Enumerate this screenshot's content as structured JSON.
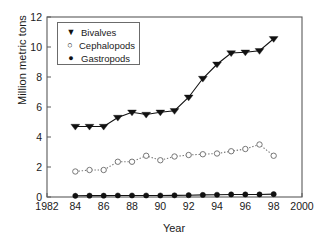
{
  "chart_data": {
    "type": "line",
    "title": "",
    "xlabel": "Year",
    "ylabel": "Million metric tons",
    "xlim": [
      1982,
      2000
    ],
    "ylim": [
      0,
      12
    ],
    "xticks": [
      1982,
      1984,
      1986,
      1988,
      1990,
      1992,
      1994,
      1996,
      1998,
      2000
    ],
    "xtick_labels": [
      "1982",
      "84",
      "86",
      "88",
      "90",
      "92",
      "94",
      "96",
      "98",
      "2000"
    ],
    "yticks": [
      0,
      2,
      4,
      6,
      8,
      10,
      12
    ],
    "ytick_labels": [
      "0",
      "2",
      "4",
      "6",
      "8",
      "10",
      "12"
    ],
    "grid": false,
    "legend_position": "upper left",
    "x": [
      1984,
      1985,
      1986,
      1987,
      1988,
      1989,
      1990,
      1991,
      1992,
      1993,
      1994,
      1995,
      1996,
      1997,
      1998
    ],
    "series": [
      {
        "name": "Bivalves",
        "marker": "filled-triangle-down",
        "linestyle": "solid",
        "color": "#111111",
        "values": [
          4.7,
          4.7,
          4.7,
          5.3,
          5.65,
          5.5,
          5.65,
          5.75,
          6.65,
          7.9,
          8.85,
          9.6,
          9.65,
          9.75,
          10.55
        ]
      },
      {
        "name": "Cephalopods",
        "marker": "open-circle",
        "linestyle": "dotted",
        "color": "#777777",
        "values": [
          1.7,
          1.8,
          1.8,
          2.35,
          2.35,
          2.75,
          2.45,
          2.7,
          2.8,
          2.85,
          2.9,
          3.05,
          3.2,
          3.5,
          2.75
        ]
      },
      {
        "name": "Gastropods",
        "marker": "filled-circle",
        "linestyle": "solid",
        "color": "#111111",
        "values": [
          0.08,
          0.09,
          0.09,
          0.1,
          0.1,
          0.1,
          0.1,
          0.11,
          0.12,
          0.14,
          0.15,
          0.17,
          0.17,
          0.17,
          0.19
        ]
      }
    ]
  },
  "legend": {
    "items": [
      {
        "marker": "▼",
        "label": "Bivalves"
      },
      {
        "marker": "○",
        "label": "Cephalopods"
      },
      {
        "marker": "●",
        "label": "Gastropods"
      }
    ]
  },
  "axes": {
    "x_title": "Year",
    "y_title": "Million metric tons"
  }
}
